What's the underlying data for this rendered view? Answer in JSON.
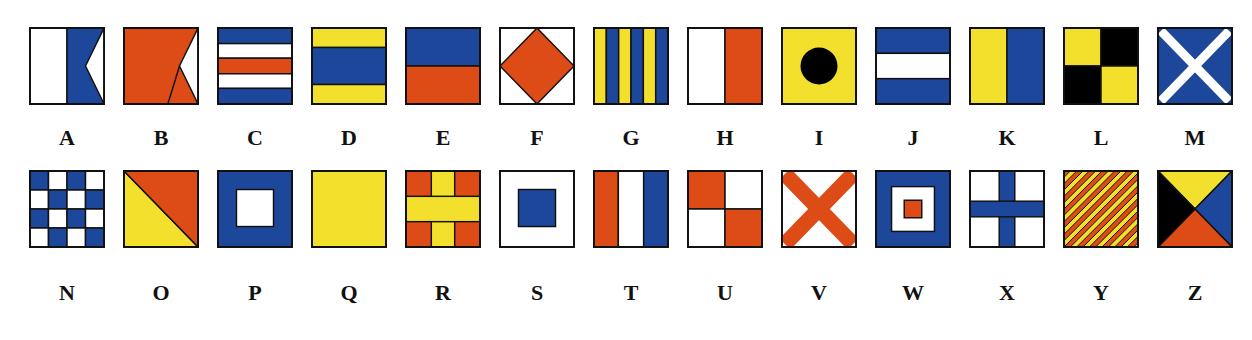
{
  "colors": {
    "red": "#dd4b16",
    "blue": "#1d479a",
    "yellow": "#f2e02c",
    "white": "#ffffff",
    "black": "#000000"
  },
  "flags": [
    {
      "letter": "A",
      "desc": "White hoist, blue swallowtail fly"
    },
    {
      "letter": "B",
      "desc": "Red swallowtail"
    },
    {
      "letter": "C",
      "desc": "Blue, white, red, white, blue horizontal stripes"
    },
    {
      "letter": "D",
      "desc": "Yellow, blue, yellow horizontal bands"
    },
    {
      "letter": "E",
      "desc": "Blue top, red bottom"
    },
    {
      "letter": "F",
      "desc": "White with red diamond"
    },
    {
      "letter": "G",
      "desc": "Yellow and blue vertical stripes"
    },
    {
      "letter": "H",
      "desc": "White hoist, red fly"
    },
    {
      "letter": "I",
      "desc": "Yellow with black circle"
    },
    {
      "letter": "J",
      "desc": "Blue, white, blue horizontal bands"
    },
    {
      "letter": "K",
      "desc": "Yellow hoist, blue fly"
    },
    {
      "letter": "L",
      "desc": "Yellow and black quarters"
    },
    {
      "letter": "M",
      "desc": "Blue with white saltire"
    },
    {
      "letter": "N",
      "desc": "Blue and white checkerboard"
    },
    {
      "letter": "O",
      "desc": "Red and yellow diagonal halves"
    },
    {
      "letter": "P",
      "desc": "Blue with white square center"
    },
    {
      "letter": "Q",
      "desc": "Solid yellow"
    },
    {
      "letter": "R",
      "desc": "Red with yellow cross"
    },
    {
      "letter": "S",
      "desc": "White with blue square center"
    },
    {
      "letter": "T",
      "desc": "Red, white, blue vertical bands"
    },
    {
      "letter": "U",
      "desc": "Red and white quarters"
    },
    {
      "letter": "V",
      "desc": "White with red saltire"
    },
    {
      "letter": "W",
      "desc": "Blue border, white square, red center"
    },
    {
      "letter": "X",
      "desc": "White with blue cross"
    },
    {
      "letter": "Y",
      "desc": "Red and yellow diagonal stripes"
    },
    {
      "letter": "Z",
      "desc": "Yellow, blue, red, black triangles"
    }
  ]
}
